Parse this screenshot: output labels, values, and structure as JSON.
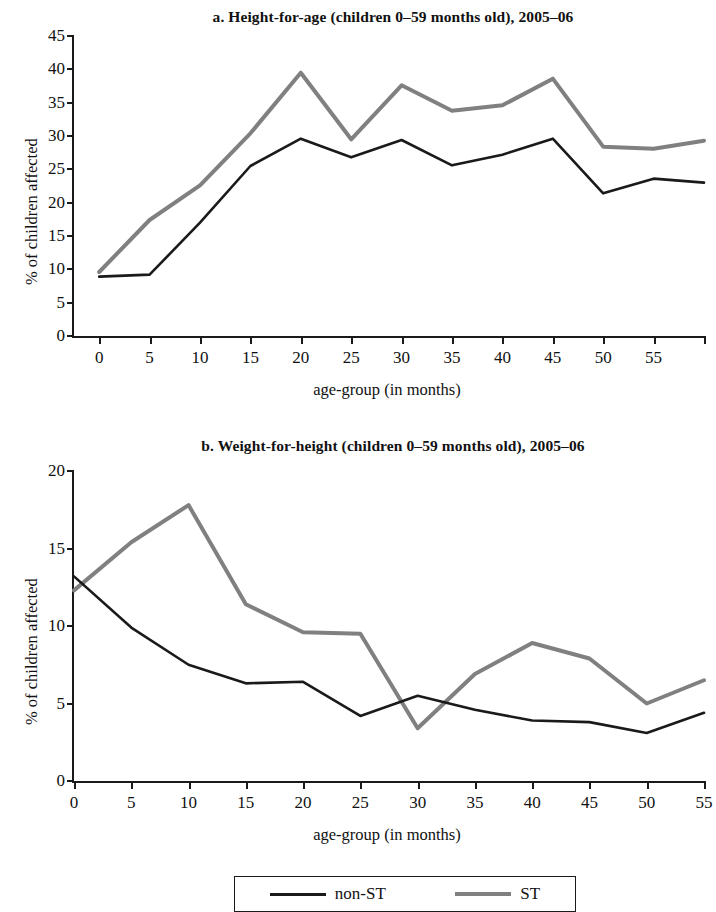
{
  "charts": {
    "a": {
      "title": "a. Height-for-age (children 0–59 months old), 2005–06",
      "xlabel": "age-group (in months)",
      "ylabel": "% of children affected"
    },
    "b": {
      "title": "b. Weight-for-height (children 0–59 months old), 2005–06",
      "xlabel": "age-group (in months)",
      "ylabel": "% of children affected"
    }
  },
  "legend": {
    "entries": [
      {
        "label": "non-ST",
        "color": "#1a1a1a",
        "style": "dark"
      },
      {
        "label": "ST",
        "color": "#808080",
        "style": "gray"
      }
    ]
  },
  "chart_data": [
    {
      "type": "line",
      "panel": "a",
      "title": "a. Height-for-age (children 0–59 months old), 2005–06",
      "xlabel": "age-group (in months)",
      "ylabel": "% of children affected",
      "x": [
        0,
        5,
        10,
        15,
        20,
        25,
        30,
        35,
        40,
        45,
        50,
        55
      ],
      "xticklabels": [
        "0",
        "5",
        "10",
        "15",
        "20",
        "25",
        "30",
        "35",
        "40",
        "45",
        "50",
        "55"
      ],
      "xlim": [
        -2.5,
        60
      ],
      "ylim": [
        0,
        45
      ],
      "yticks": [
        0,
        5,
        10,
        15,
        20,
        25,
        30,
        35,
        40,
        45
      ],
      "grid": false,
      "legend_position": "bottom",
      "series": [
        {
          "name": "non-ST",
          "color": "#1a1a1a",
          "values": [
            8.9,
            9.2,
            17.0,
            25.5,
            29.6,
            26.8,
            29.4,
            25.6,
            27.2,
            29.6,
            21.4,
            23.6
          ],
          "final_value": 23.0
        },
        {
          "name": "ST",
          "color": "#808080",
          "values": [
            9.6,
            17.4,
            22.6,
            30.4,
            39.5,
            29.5,
            37.6,
            33.8,
            34.6,
            38.6,
            28.4,
            28.1
          ],
          "final_value": 29.3
        }
      ]
    },
    {
      "type": "line",
      "panel": "b",
      "title": "b. Weight-for-height (children 0–59 months old), 2005–06",
      "xlabel": "age-group (in months)",
      "ylabel": "% of children affected",
      "x": [
        0,
        5,
        10,
        15,
        20,
        25,
        30,
        35,
        40,
        45,
        50,
        55
      ],
      "xticklabels": [
        "0",
        "5",
        "10",
        "15",
        "20",
        "25",
        "30",
        "35",
        "40",
        "45",
        "50",
        "55"
      ],
      "xlim": [
        0,
        55
      ],
      "ylim": [
        0,
        20
      ],
      "yticks": [
        0,
        5,
        10,
        15,
        20
      ],
      "grid": false,
      "legend_position": "bottom",
      "series": [
        {
          "name": "non-ST",
          "color": "#1a1a1a",
          "values": [
            13.2,
            9.9,
            7.5,
            6.3,
            6.4,
            4.2,
            5.5,
            4.6,
            3.9,
            3.8,
            3.1,
            4.4
          ]
        },
        {
          "name": "ST",
          "color": "#808080",
          "values": [
            12.3,
            15.4,
            17.8,
            11.4,
            9.6,
            9.5,
            3.4,
            6.9,
            8.9,
            7.9,
            5.0,
            6.5
          ]
        }
      ]
    }
  ]
}
